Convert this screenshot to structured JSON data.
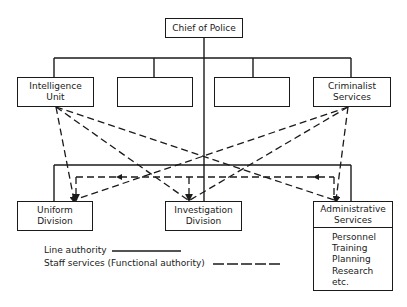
{
  "chart": {
    "top": {
      "label": "Chief of Police"
    },
    "staff_units": [
      {
        "line1": "Intelligence",
        "line2": "Unit"
      },
      {
        "line1": "",
        "line2": ""
      },
      {
        "line1": "",
        "line2": ""
      },
      {
        "line1": "Criminalist",
        "line2": "Services"
      }
    ],
    "divisions": [
      {
        "line1": "Uniform",
        "line2": "Division"
      },
      {
        "line1": "Investigation",
        "line2": "Division"
      }
    ],
    "admin": {
      "line1": "Administrative",
      "line2": "Services",
      "items": [
        "Personnel",
        "Training",
        "Planning",
        "Research",
        "etc."
      ]
    }
  },
  "legend": {
    "line_authority": "Line authority",
    "staff_services": "Staff services (Functional authority)"
  },
  "colors": {
    "ink": "#1a1a1a",
    "background": "#ffffff"
  }
}
